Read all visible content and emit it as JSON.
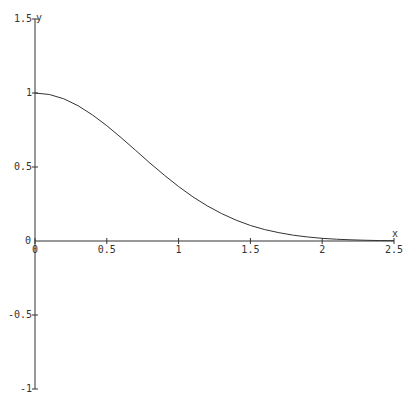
{
  "chart_data": {
    "type": "line",
    "title": "",
    "xlabel": "x",
    "ylabel": "y",
    "xlim": [
      0,
      2.5
    ],
    "ylim": [
      -1,
      1.5
    ],
    "grid": false,
    "x_ticks": [
      0,
      0.5,
      1,
      1.5,
      2,
      2.5
    ],
    "x_tick_labels": [
      "0",
      "0.5",
      "1",
      "1.5",
      "2",
      "2.5"
    ],
    "y_ticks": [
      -1,
      -0.5,
      0,
      0.5,
      1,
      1.5
    ],
    "y_tick_labels": [
      "-1",
      "-0.5",
      "0",
      "0.5",
      "1",
      "1.5"
    ],
    "series": [
      {
        "name": "exp(-x^2)",
        "x": [
          0,
          0.1,
          0.2,
          0.3,
          0.4,
          0.5,
          0.6,
          0.7,
          0.8,
          0.9,
          1.0,
          1.1,
          1.2,
          1.3,
          1.4,
          1.5,
          1.6,
          1.7,
          1.8,
          1.9,
          2.0,
          2.1,
          2.2,
          2.3,
          2.4,
          2.5
        ],
        "y": [
          1.0,
          0.99,
          0.961,
          0.914,
          0.852,
          0.779,
          0.698,
          0.613,
          0.527,
          0.445,
          0.368,
          0.298,
          0.237,
          0.185,
          0.141,
          0.105,
          0.077,
          0.056,
          0.039,
          0.027,
          0.018,
          0.012,
          0.008,
          0.005,
          0.003,
          0.002
        ]
      }
    ]
  }
}
